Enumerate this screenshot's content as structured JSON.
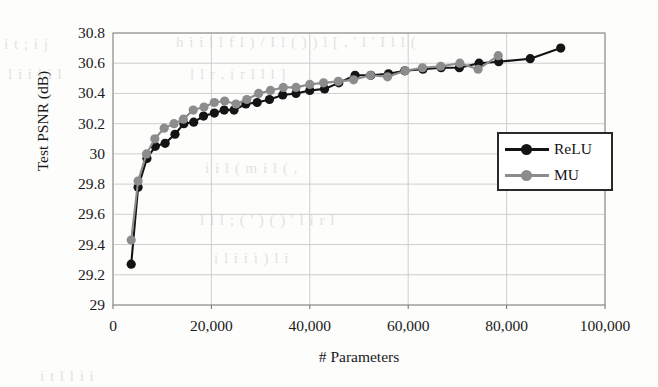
{
  "figure": {
    "background_color": "#fdfdfc",
    "plot_area": {
      "left": 113,
      "top": 33,
      "right": 605,
      "bottom": 305
    }
  },
  "bleed_through": [
    {
      "text": "i t ;  i j",
      "x": 4,
      "y": 36
    },
    {
      "text": "l i i l  i l",
      "x": 8,
      "y": 66
    },
    {
      "text": "h i i l  l f  l ) / I   l ( ) ) l [ ,  ' l  ' I l l (",
      "x": 176,
      "y": 34
    },
    {
      "text": "l  l  r , i  r  l l  l ]",
      "x": 190,
      "y": 66
    },
    {
      "text": "i  i  l  (  m i l ( ,",
      "x": 205,
      "y": 160
    },
    {
      "text": "l  l  l ; ( ' ) ( ) ' l  i  r   l",
      "x": 200,
      "y": 212
    },
    {
      "text": "i  l  i i   i  ) l i",
      "x": 214,
      "y": 250
    },
    {
      "text": "i  t  l  l  i i",
      "x": 40,
      "y": 368
    }
  ],
  "chart_data": {
    "type": "line",
    "title": "",
    "xlabel": "# Parameters",
    "ylabel": "Test PSNR (dB)",
    "xlim": [
      0,
      100000
    ],
    "ylim": [
      29,
      30.8
    ],
    "xticks": [
      0,
      20000,
      40000,
      60000,
      80000,
      100000
    ],
    "xtick_labels": [
      "0",
      "20,000",
      "40,000",
      "60,000",
      "80,000",
      "100,000"
    ],
    "yticks": [
      29,
      29.2,
      29.4,
      29.6,
      29.8,
      30,
      30.2,
      30.4,
      30.6,
      30.8
    ],
    "ytick_labels": [
      "29",
      "29.2",
      "29.4",
      "29.6",
      "29.8",
      "30",
      "30.2",
      "30.4",
      "30.6",
      "30.8"
    ],
    "grid": true,
    "grid_axis": "both",
    "grid_color": "#c9c9c9",
    "legend_position": "center right",
    "marker": "circle",
    "series": [
      {
        "name": "ReLU",
        "color": "#141414",
        "points": [
          [
            3700,
            29.27
          ],
          [
            5100,
            29.78
          ],
          [
            6900,
            29.97
          ],
          [
            8600,
            30.05
          ],
          [
            10600,
            30.07
          ],
          [
            12600,
            30.13
          ],
          [
            14400,
            30.2
          ],
          [
            16400,
            30.21
          ],
          [
            18400,
            30.25
          ],
          [
            20600,
            30.27
          ],
          [
            22600,
            30.29
          ],
          [
            24600,
            30.29
          ],
          [
            27000,
            30.33
          ],
          [
            29300,
            30.34
          ],
          [
            31800,
            30.36
          ],
          [
            34500,
            30.39
          ],
          [
            37200,
            30.4
          ],
          [
            40000,
            30.42
          ],
          [
            43000,
            30.43
          ],
          [
            45900,
            30.47
          ],
          [
            49200,
            30.52
          ],
          [
            52400,
            30.52
          ],
          [
            56000,
            30.53
          ],
          [
            59300,
            30.55
          ],
          [
            63000,
            30.56
          ],
          [
            66700,
            30.57
          ],
          [
            70400,
            30.57
          ],
          [
            74400,
            30.6
          ],
          [
            78400,
            30.61
          ],
          [
            84800,
            30.63
          ],
          [
            91000,
            30.7
          ]
        ]
      },
      {
        "name": "MU",
        "color": "#8c8c8c",
        "points": [
          [
            3700,
            29.43
          ],
          [
            5100,
            29.82
          ],
          [
            6800,
            30.0
          ],
          [
            8500,
            30.1
          ],
          [
            10400,
            30.17
          ],
          [
            12400,
            30.2
          ],
          [
            14300,
            30.23
          ],
          [
            16300,
            30.29
          ],
          [
            18500,
            30.31
          ],
          [
            20600,
            30.34
          ],
          [
            22700,
            30.35
          ],
          [
            25000,
            30.33
          ],
          [
            27200,
            30.36
          ],
          [
            29600,
            30.4
          ],
          [
            32000,
            30.42
          ],
          [
            34600,
            30.44
          ],
          [
            37200,
            30.44
          ],
          [
            40000,
            30.46
          ],
          [
            42800,
            30.47
          ],
          [
            45800,
            30.48
          ],
          [
            48900,
            30.49
          ],
          [
            52300,
            30.52
          ],
          [
            55800,
            30.51
          ],
          [
            59400,
            30.55
          ],
          [
            62900,
            30.57
          ],
          [
            66600,
            30.58
          ],
          [
            70500,
            30.6
          ],
          [
            74200,
            30.56
          ],
          [
            78300,
            30.65
          ]
        ]
      }
    ]
  }
}
